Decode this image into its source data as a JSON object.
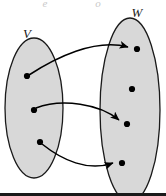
{
  "figure": {
    "title": "",
    "background_color": "#ffffff",
    "colors": {
      "set_fill": "#d8d8d8",
      "set_stroke": "#1a1a1a",
      "dot": "#000000",
      "arrow": "#000000",
      "label": "#1a1a1a",
      "ghost": "#c9c9c9",
      "footer_bar": "#1a1a1a"
    }
  },
  "sets": [
    {
      "id": "set-v",
      "label": "V",
      "label_x": 27,
      "label_y": 38,
      "cx": 34,
      "cy": 108,
      "rx": 29,
      "ry": 70,
      "elements": [
        {
          "id": "v1",
          "x": 27,
          "y": 76
        },
        {
          "id": "v2",
          "x": 34,
          "y": 110
        },
        {
          "id": "v3",
          "x": 40,
          "y": 142
        }
      ]
    },
    {
      "id": "set-w",
      "label": "W",
      "label_x": 137,
      "label_y": 17,
      "cx": 130,
      "cy": 110,
      "rx": 30,
      "ry": 92,
      "elements": [
        {
          "id": "w1",
          "x": 137,
          "y": 49
        },
        {
          "id": "w2",
          "x": 132,
          "y": 89
        },
        {
          "id": "w3",
          "x": 127,
          "y": 124
        },
        {
          "id": "w4",
          "x": 122,
          "y": 163
        }
      ]
    }
  ],
  "arrows": [
    {
      "id": "arrow-v1-w1",
      "from": "v1",
      "to": "w1",
      "path": "M 29 75 C 55 58 95 38 128 47"
    },
    {
      "id": "arrow-v2-w3",
      "from": "v2",
      "to": "w3",
      "path": "M 36 108 C 62 98 100 104 119 120"
    },
    {
      "id": "arrow-v3-w4",
      "from": "v3",
      "to": "w4",
      "path": "M 42 144 C 62 160 88 172 113 163"
    }
  ],
  "ghost_marks": [
    {
      "id": "ghost-left",
      "text": "e",
      "x": 45,
      "y": 7
    },
    {
      "id": "ghost-right",
      "text": "o",
      "x": 98,
      "y": 7
    }
  ],
  "dot_radius": 3.1,
  "footer_bar": {
    "x": 0,
    "y": 193,
    "width": 166,
    "height": 3
  }
}
